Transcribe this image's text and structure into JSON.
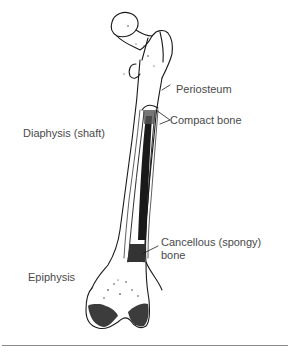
{
  "diagram": {
    "labels": {
      "periosteum": "Periosteum",
      "compact_bone": "Compact bone",
      "diaphysis": "Diaphysis (shaft)",
      "cancellous_line1": "Cancellous (spongy)",
      "cancellous_line2": "bone",
      "epiphysis": "Epiphysis"
    },
    "colors": {
      "ink": "#1a1a1a",
      "label_text": "#4a4a4a",
      "rule": "#8a8a8a",
      "background": "#ffffff"
    }
  }
}
